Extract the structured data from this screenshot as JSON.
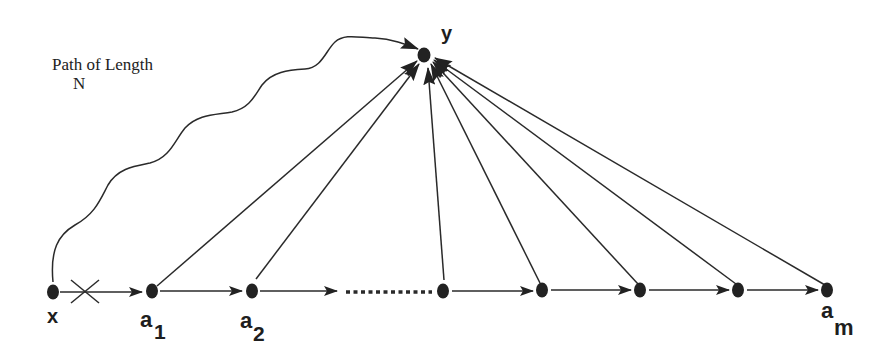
{
  "caption": {
    "line1": "Path of Length",
    "line2": "N"
  },
  "nodes": {
    "y": {
      "label": "y",
      "cx": 424,
      "cy": 55
    },
    "x": {
      "label": "x",
      "cx": 53,
      "cy": 292
    },
    "a1": {
      "label": "a",
      "sub": "1",
      "cx": 152,
      "cy": 291
    },
    "a2": {
      "label": "a",
      "sub": "2",
      "cx": 252,
      "cy": 291
    },
    "n4": {
      "cx": 443,
      "cy": 291
    },
    "n5": {
      "cx": 542,
      "cy": 290
    },
    "n6": {
      "cx": 640,
      "cy": 290
    },
    "n7": {
      "cx": 738,
      "cy": 290
    },
    "am": {
      "label": "a",
      "sub": "m",
      "cx": 827,
      "cy": 290
    }
  },
  "edges": {
    "x_to_a1": "blocked (crossed out)",
    "chain": [
      "a1→a2",
      "a2→…",
      "…→n4",
      "n4→n5",
      "n5→n6",
      "n6→n7",
      "n7→am"
    ],
    "to_y": [
      "a1",
      "a2",
      "n4",
      "n5",
      "n6",
      "n7",
      "am"
    ],
    "wavy_path": "x → y (Path of Length N)"
  },
  "colors": {
    "ink": "#222222",
    "background": "#ffffff"
  }
}
